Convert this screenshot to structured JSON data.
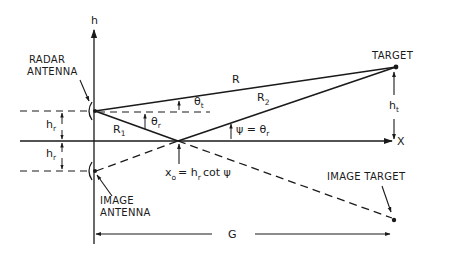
{
  "diagram": {
    "type": "multipath reflection geometry (flat earth)",
    "axes": {
      "vertical_label": "h",
      "horizontal_label": "X"
    },
    "labels": {
      "radar_antenna_line1": "RADAR",
      "radar_antenna_line2": "ANTENNA",
      "image_antenna_line1": "IMAGE",
      "image_antenna_line2": "ANTENNA",
      "target": "TARGET",
      "image_target": "IMAGE TARGET",
      "direct_path": "R",
      "path_r1": "R",
      "path_r1_sub": "1",
      "path_r2": "R",
      "path_r2_sub": "2",
      "theta_t": "θ",
      "theta_t_sub": "t",
      "theta_r": "θ",
      "theta_r_sub": "r",
      "psi_eq_left": "ψ = θ",
      "psi_eq_sub": "r",
      "hr_upper": "h",
      "hr_upper_sub": "r",
      "hr_lower": "h",
      "hr_lower_sub": "r",
      "ht": "h",
      "ht_sub": "t",
      "x0_x": "x",
      "x0_sub": "o",
      "x0_eq": "= h",
      "x0_eq_sub": "r",
      "x0_rest": "cot ψ",
      "ground_range": "G"
    },
    "colors": {
      "ink": "#1a1a1a",
      "background": "#ffffff"
    }
  }
}
